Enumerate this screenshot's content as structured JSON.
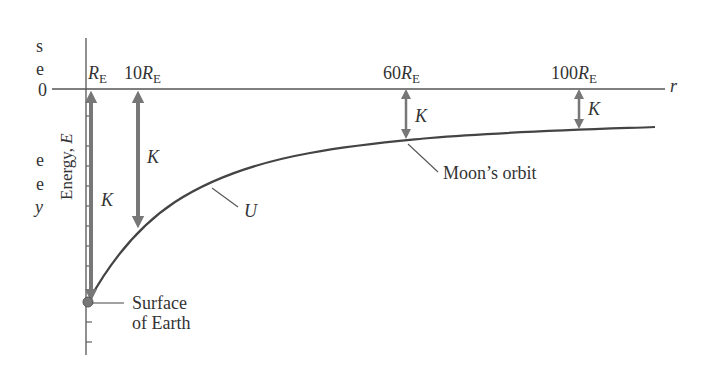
{
  "diagram": {
    "y_axis": {
      "label_main": "Energy, ",
      "label_var": "E",
      "zero_label": "0"
    },
    "x_axis": {
      "label": "r"
    },
    "ticks": [
      {
        "coef": "",
        "sym": "R",
        "sub": "E",
        "x": 87
      },
      {
        "coef": "10",
        "sym": "R",
        "sub": "E",
        "x": 138
      },
      {
        "coef": "60",
        "sym": "R",
        "sub": "E",
        "x": 406
      },
      {
        "coef": "100",
        "sym": "R",
        "sub": "E",
        "x": 579
      }
    ],
    "curve_label": "U",
    "kinetic_label": "K",
    "annotations": {
      "moon": "Moon’s orbit",
      "surface_line1": "Surface",
      "surface_line2": "of Earth"
    },
    "margin_fragments": [
      "s",
      "e",
      "e",
      "e",
      "y"
    ],
    "colors": {
      "curve": "#444444",
      "arrow": "#777777",
      "axis": "#555555",
      "text": "#333333"
    }
  }
}
